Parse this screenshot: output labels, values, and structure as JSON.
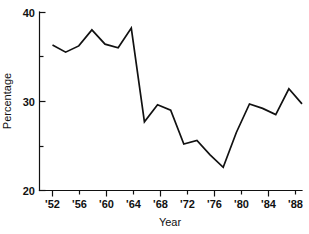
{
  "chart_data": {
    "type": "line",
    "title": "",
    "xlabel": "Year",
    "ylabel": "Percentage",
    "xlim": [
      1952,
      1990
    ],
    "ylim": [
      20,
      40
    ],
    "grid": false,
    "legend": null,
    "y_ticks": [
      20,
      30,
      40
    ],
    "y_tick_labels": [
      "20",
      "30",
      "40"
    ],
    "y_minor_ticks": [
      25,
      35
    ],
    "x_ticks": [
      1952,
      1956,
      1960,
      1964,
      1968,
      1972,
      1976,
      1980,
      1984,
      1988
    ],
    "x_tick_labels": [
      "'52",
      "'56",
      "'60",
      "'64",
      "'68",
      "'72",
      "'76",
      "'80",
      "'84",
      "'88"
    ],
    "x_minor_ticks": [
      1954,
      1958,
      1962,
      1966,
      1970,
      1974,
      1978,
      1982,
      1986,
      1990
    ],
    "series": [
      {
        "name": "Percentage",
        "color": "#111111",
        "x": [
          1952,
          1954,
          1956,
          1958,
          1960,
          1962,
          1964,
          1966,
          1968,
          1970,
          1972,
          1974,
          1976,
          1978,
          1980,
          1982,
          1984,
          1986,
          1988,
          1990
        ],
        "values": [
          36.3,
          35.5,
          36.2,
          38.0,
          36.4,
          36.0,
          38.2,
          27.7,
          29.6,
          29.0,
          25.2,
          25.6,
          24.0,
          22.6,
          26.5,
          29.7,
          29.2,
          28.5,
          31.4,
          29.7
        ]
      }
    ]
  },
  "axes": {
    "y_label": "Percentage",
    "x_label": "Year"
  }
}
